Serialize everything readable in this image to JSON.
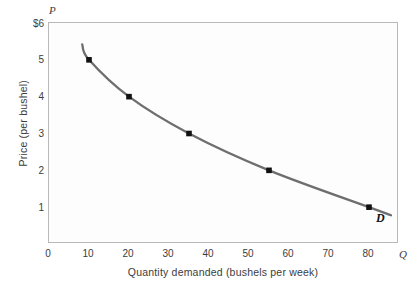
{
  "chart_data": {
    "type": "line",
    "title": "",
    "subtitle": "",
    "xlabel": "Quantity demanded (bushels per week)",
    "ylabel": "Price (per bushel)",
    "x_axis_symbol": "Q",
    "y_axis_symbol": "P",
    "xlim": [
      0,
      87.5
    ],
    "ylim": [
      0,
      6
    ],
    "grid": false,
    "legend_position": "inline-right",
    "x_ticks": [
      {
        "value": 0,
        "label": "0"
      },
      {
        "value": 10,
        "label": "10"
      },
      {
        "value": 20,
        "label": "20"
      },
      {
        "value": 30,
        "label": "30"
      },
      {
        "value": 40,
        "label": "40"
      },
      {
        "value": 50,
        "label": "50"
      },
      {
        "value": 60,
        "label": "60"
      },
      {
        "value": 70,
        "label": "70"
      },
      {
        "value": 80,
        "label": "80"
      }
    ],
    "y_ticks": [
      {
        "value": 6,
        "label": "$6"
      },
      {
        "value": 5,
        "label": "5"
      },
      {
        "value": 4,
        "label": "4"
      },
      {
        "value": 3,
        "label": "3"
      },
      {
        "value": 2,
        "label": "2"
      },
      {
        "value": 1,
        "label": "1"
      }
    ],
    "series": [
      {
        "name": "D",
        "annotation": "D",
        "color": "#6e6e6e",
        "marker_color": "#111111",
        "x": [
          10,
          20,
          35,
          55,
          80
        ],
        "y": [
          5,
          4,
          3,
          2,
          1
        ],
        "points": [
          {
            "quantity": 10,
            "price": 5
          },
          {
            "quantity": 20,
            "price": 4
          },
          {
            "quantity": 35,
            "price": 3
          },
          {
            "quantity": 55,
            "price": 2
          },
          {
            "quantity": 80,
            "price": 1
          }
        ]
      }
    ]
  },
  "figure": {
    "background_color": "#ffffff",
    "plot_background_color": "#fdfdfd",
    "frame_color": "#b9b9b9",
    "text_color": "#3c3c3c"
  }
}
